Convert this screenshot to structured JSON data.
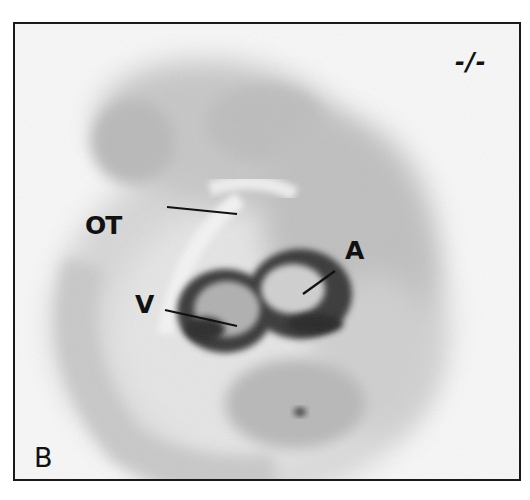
{
  "figure": {
    "panel_letter": "B",
    "genotype": "-/-",
    "annotations": [
      {
        "id": "ot",
        "text": "OT"
      },
      {
        "id": "a",
        "text": "A"
      },
      {
        "id": "v",
        "text": "V"
      }
    ]
  },
  "colors": {
    "frame": "#1a1a1a",
    "background": "#f6f6f6",
    "tissue_light": "#c9c9c9",
    "tissue_mid": "#a8a8a8",
    "stain_dark": "#2b2b2b",
    "label": "#111111"
  }
}
